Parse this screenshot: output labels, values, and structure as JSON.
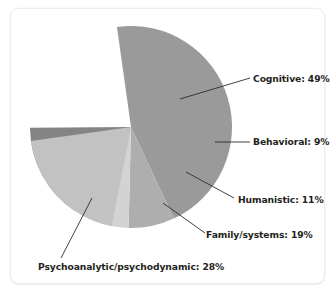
{
  "chart_data": {
    "type": "pie",
    "title": "",
    "subtitle": "",
    "xlabel": "",
    "ylabel": "",
    "legend_position": "none",
    "grid": false,
    "labels_inline": true,
    "unit": "%",
    "note": "Percentages sum to 116% because respondents could select more than one theoretical orientation.",
    "categories": [
      "Cognitive",
      "Behavioral",
      "Humanistic",
      "Family/systems",
      "Psychoanalytic/psychodynamic"
    ],
    "values": [
      49,
      9,
      11,
      19,
      28
    ],
    "slices": [
      {
        "name": "Cognitive",
        "label": "Cognitive: 49%",
        "value": 49,
        "color": "#9a9a9b",
        "start_angle": -8,
        "sweep": 171.9
      },
      {
        "name": "Behavioral",
        "label": "Behavioral: 9%",
        "value": 9,
        "color": "#aeaeaf",
        "start_angle": 163.9,
        "sweep": 27.9
      },
      {
        "name": "Humanistic",
        "label": "Humanistic: 11%",
        "value": 11,
        "color": "#d3d3d4",
        "start_angle": 191.8,
        "sweep": 34.1
      },
      {
        "name": "Family/systems",
        "label": "Family/systems: 19%",
        "value": 19,
        "color": "#848485",
        "start_angle": 225.9,
        "sweep": 59.0
      },
      {
        "name": "Psychoanalytic/psychodynamic",
        "label": "Psychoanalytic/psychodynamic: 28%",
        "value": 28,
        "color": "#c2c2c3",
        "start_angle": 284.9,
        "sweep": 86.9
      }
    ],
    "colors": {
      "cognitive": "#9a9a9b",
      "behavioral": "#aeaeaf",
      "humanistic": "#d3d3d4",
      "family_systems": "#848485",
      "psychoanalytic": "#c2c2c3",
      "leader_line": "#2b2b2b",
      "label_text": "#231f20",
      "card_background": "#ffffff",
      "card_border": "#eceded"
    }
  }
}
